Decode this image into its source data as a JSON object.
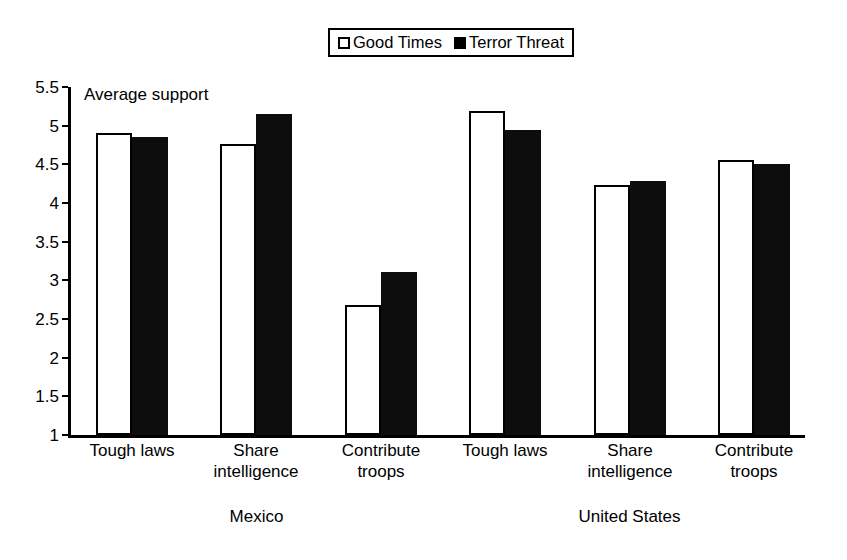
{
  "chart_data": {
    "type": "bar",
    "title": "",
    "subtitle": "",
    "ylabel": "Average support",
    "xlabel": "",
    "ylim": [
      1,
      5.5
    ],
    "grid": false,
    "legend_position": "top-center",
    "y_ticks": [
      "5.5",
      "5",
      "4.5",
      "4",
      "3.5",
      "3",
      "2.5",
      "2",
      "1.5",
      "1"
    ],
    "y_tick_values": [
      5.5,
      5,
      4.5,
      4,
      3.5,
      3,
      2.5,
      2,
      1.5,
      1
    ],
    "categories": [
      "Tough laws",
      "Share intelligence",
      "Contribute troops",
      "Tough laws",
      "Share intelligence",
      "Contribute troops"
    ],
    "category_lines": [
      [
        "Tough laws"
      ],
      [
        "Share",
        "intelligence"
      ],
      [
        "Contribute",
        "troops"
      ],
      [
        "Tough laws"
      ],
      [
        "Share",
        "intelligence"
      ],
      [
        "Contribute",
        "troops"
      ]
    ],
    "groups": [
      {
        "label": "Mexico",
        "categories": [
          0,
          1,
          2
        ]
      },
      {
        "label": "United States",
        "categories": [
          3,
          4,
          5
        ]
      }
    ],
    "series": [
      {
        "name": "Good Times",
        "color": "#ffffff",
        "edge_color": "#000000",
        "values": [
          4.9,
          4.76,
          2.68,
          5.19,
          4.23,
          4.56
        ]
      },
      {
        "name": "Terror Threat",
        "color": "#0d0d0d",
        "edge_color": "#000000",
        "values": [
          4.85,
          5.15,
          3.11,
          4.94,
          4.28,
          4.51
        ]
      }
    ]
  },
  "legend": {
    "entries": [
      {
        "label": "Good Times",
        "swatch": "hollow"
      },
      {
        "label": "Terror Threat",
        "swatch": "filled"
      }
    ]
  },
  "colors": {
    "good_times": "#ffffff",
    "terror_threat": "#0d0d0d",
    "axis": "#000000",
    "background": "#ffffff"
  }
}
